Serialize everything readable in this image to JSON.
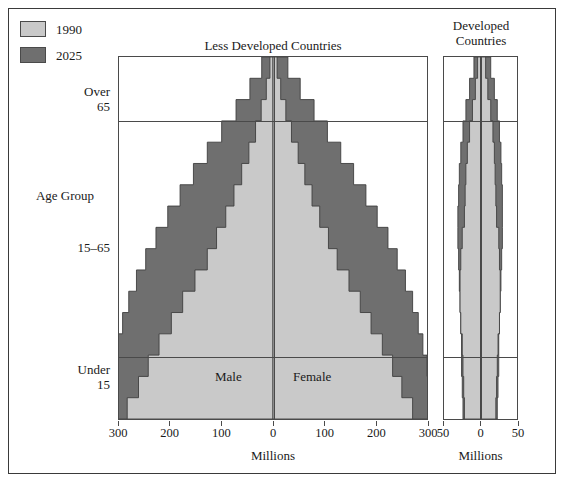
{
  "legend": {
    "items": [
      {
        "label": "1990",
        "color": "#c9c9c9",
        "icon": "legend-swatch-light"
      },
      {
        "label": "2025",
        "color": "#6f6f6f",
        "icon": "legend-swatch-dark"
      }
    ]
  },
  "axis_labels": {
    "y_title": "Age Group",
    "y_over": "Over\n65",
    "y_mid": "15–65",
    "y_under": "Under\n15"
  },
  "plot_labels": {
    "male": "Male",
    "female": "Female"
  },
  "chart_data": {
    "type": "bar",
    "subtype": "population-pyramid",
    "title": "",
    "xlabel": "Millions",
    "ylabel": "Age Group",
    "grid": false,
    "legend_position": "top-left",
    "series": [
      {
        "name": "1990",
        "color": "#c9c9c9"
      },
      {
        "name": "2025",
        "color": "#6f6f6f"
      }
    ],
    "age_bands": [
      "Under 15",
      "15–65",
      "Over 65"
    ],
    "panels": [
      {
        "name": "less-developed-countries",
        "title": "Less Developed Countries",
        "xlabel": "Millions",
        "xlim": [
          -300,
          300
        ],
        "xticks": [
          -300,
          -200,
          -100,
          0,
          100,
          200,
          300
        ],
        "xticklabels": [
          "300",
          "200",
          "100",
          "0",
          "100",
          "200",
          "300"
        ],
        "cohorts": [
          "0–4",
          "5–9",
          "10–14",
          "15–19",
          "20–24",
          "25–29",
          "30–34",
          "35–39",
          "40–44",
          "45–49",
          "50–54",
          "55–59",
          "60–64",
          "65–69",
          "70–74",
          "75–79",
          "80+"
        ],
        "male_1990": [
          284,
          262,
          243,
          222,
          198,
          176,
          152,
          128,
          110,
          92,
          76,
          61,
          47,
          34,
          23,
          13,
          6
        ],
        "female_1990": [
          272,
          251,
          233,
          213,
          191,
          170,
          148,
          125,
          108,
          91,
          76,
          62,
          49,
          36,
          25,
          15,
          8
        ],
        "male_2025": [
          322,
          318,
          312,
          303,
          293,
          281,
          266,
          248,
          228,
          205,
          181,
          155,
          128,
          100,
          72,
          45,
          22
        ],
        "female_2025": [
          308,
          305,
          300,
          292,
          283,
          272,
          258,
          242,
          224,
          203,
          181,
          157,
          132,
          106,
          80,
          53,
          29
        ]
      },
      {
        "name": "developed-countries",
        "title": "Developed\nCountries",
        "title_line1": "Developed",
        "title_line2": "Countries",
        "xlabel": "Millions",
        "xlim": [
          -50,
          50
        ],
        "xticks": [
          -50,
          0,
          50
        ],
        "xticklabels": [
          "50",
          "0",
          "50"
        ],
        "cohorts": [
          "0–4",
          "5–9",
          "10–14",
          "15–19",
          "20–24",
          "25–29",
          "30–34",
          "35–39",
          "40–44",
          "45–49",
          "50–54",
          "55–59",
          "60–64",
          "65–69",
          "70–74",
          "75–79",
          "80+"
        ],
        "male_1990": [
          22,
          23,
          24,
          25,
          27,
          28,
          28,
          27,
          25,
          22,
          21,
          20,
          18,
          15,
          11,
          7,
          4
        ],
        "female_1990": [
          21,
          22,
          23,
          24,
          26,
          27,
          27,
          26,
          25,
          22,
          21,
          20,
          19,
          17,
          14,
          10,
          7
        ],
        "male_2025": [
          24,
          25,
          26,
          26,
          27,
          28,
          29,
          30,
          31,
          31,
          30,
          29,
          27,
          24,
          20,
          15,
          9
        ],
        "female_2025": [
          23,
          24,
          25,
          25,
          26,
          27,
          28,
          29,
          30,
          30,
          30,
          29,
          28,
          26,
          23,
          19,
          14
        ]
      }
    ]
  }
}
